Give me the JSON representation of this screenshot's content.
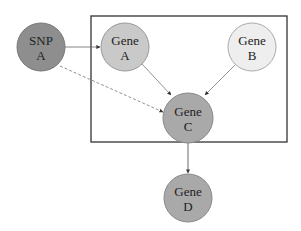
{
  "diagram": {
    "box": {
      "x": 91,
      "y": 16,
      "width": 196,
      "height": 126,
      "stroke": "#333333"
    },
    "nodes": [
      {
        "id": "snp_a",
        "line1": "SNP",
        "line2": "A",
        "cx": 41,
        "cy": 47,
        "r": 24,
        "fill": "#8e8e8e"
      },
      {
        "id": "gene_a",
        "line1": "Gene",
        "line2": "A",
        "cx": 125,
        "cy": 47,
        "r": 24,
        "fill": "#c9c9c9"
      },
      {
        "id": "gene_b",
        "line1": "Gene",
        "line2": "B",
        "cx": 252,
        "cy": 47,
        "r": 24,
        "fill": "#eeeeee"
      },
      {
        "id": "gene_c",
        "line1": "Gene",
        "line2": "C",
        "cx": 188,
        "cy": 118,
        "r": 25,
        "fill": "#a9a9a9"
      },
      {
        "id": "gene_d",
        "line1": "Gene",
        "line2": "D",
        "cx": 188,
        "cy": 198,
        "r": 24,
        "fill": "#a9a9a9"
      }
    ],
    "edges": [
      {
        "from": "SNP A",
        "to": "Gene A",
        "style": "solid"
      },
      {
        "from": "SNP A",
        "to": "Gene C",
        "style": "dashed"
      },
      {
        "from": "Gene A",
        "to": "Gene C",
        "style": "solid"
      },
      {
        "from": "Gene B",
        "to": "Gene C",
        "style": "solid"
      },
      {
        "from": "Gene C",
        "to": "Gene D",
        "style": "solid"
      }
    ]
  }
}
